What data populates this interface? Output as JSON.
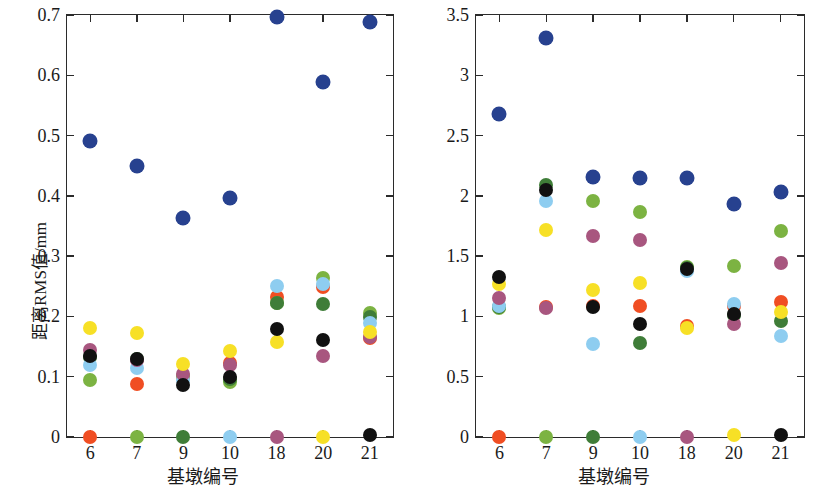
{
  "chart_data": [
    {
      "panel": "left",
      "type": "scatter",
      "title": "",
      "xlabel": "基墩编号",
      "ylabel": "距离RMS值/mm",
      "categories": [
        "6",
        "7",
        "9",
        "10",
        "18",
        "20",
        "21"
      ],
      "xtick_labels": [
        "6",
        "7",
        "9",
        "10",
        "18",
        "20",
        "21"
      ],
      "ytick_labels": [
        "0",
        "0.1",
        "0.2",
        "0.3",
        "0.4",
        "0.5",
        "0.6",
        "0.7"
      ],
      "ytick_values": [
        0,
        0.1,
        0.2,
        0.3,
        0.4,
        0.5,
        0.6,
        0.7
      ],
      "ylim": [
        0,
        0.7
      ],
      "grid": false,
      "legend": "none",
      "series": [
        {
          "name": "基墩6",
          "color": "#f04e23",
          "values": [
            0.0,
            0.088,
            0.1,
            0.122,
            0.232,
            0.248,
            0.165
          ]
        },
        {
          "name": "基墩7",
          "color": "#7cb342",
          "values": [
            0.095,
            0.0,
            0.101,
            0.092,
            0.223,
            0.264,
            0.205
          ]
        },
        {
          "name": "基墩9",
          "color": "#3f7d38",
          "values": [
            0.132,
            0.13,
            0.0,
            0.096,
            0.222,
            0.221,
            0.199
          ]
        },
        {
          "name": "基墩10",
          "color": "#8ecdf0",
          "values": [
            0.119,
            0.115,
            0.094,
            0.0,
            0.25,
            0.253,
            0.189
          ]
        },
        {
          "name": "基墩18",
          "color": "#a8567f",
          "values": [
            0.144,
            0.127,
            0.104,
            0.12,
            0.0,
            0.134,
            0.166
          ]
        },
        {
          "name": "基墩20",
          "color": "#f7e026",
          "values": [
            0.18,
            0.173,
            0.121,
            0.143,
            0.158,
            0.0,
            0.175
          ]
        },
        {
          "name": "基墩21",
          "color": "#111111",
          "values": [
            0.135,
            0.129,
            0.086,
            0.1,
            0.179,
            0.161,
            0.003
          ]
        },
        {
          "name": "整体",
          "color": "#27418f",
          "values": [
            0.491,
            0.449,
            0.364,
            0.396,
            0.697,
            0.589,
            0.688
          ]
        }
      ]
    },
    {
      "panel": "right",
      "type": "scatter",
      "title": "",
      "xlabel": "基墩编号",
      "ylabel": "垂直角RMS值/(″)",
      "categories": [
        "6",
        "7",
        "9",
        "10",
        "18",
        "20",
        "21"
      ],
      "xtick_labels": [
        "6",
        "7",
        "9",
        "10",
        "18",
        "20",
        "21"
      ],
      "ytick_labels": [
        "0",
        "0.5",
        "1",
        "1.5",
        "2",
        "2.5",
        "3",
        "3.5"
      ],
      "ytick_values": [
        0,
        0.5,
        1,
        1.5,
        2,
        2.5,
        3,
        3.5
      ],
      "ylim": [
        0,
        3.5
      ],
      "grid": false,
      "legend": "none",
      "series": [
        {
          "name": "基墩6",
          "color": "#f04e23",
          "values": [
            0.0,
            1.08,
            1.09,
            1.09,
            0.92,
            1.09,
            1.12
          ]
        },
        {
          "name": "基墩7",
          "color": "#7cb342",
          "values": [
            1.07,
            0.0,
            1.96,
            1.87,
            1.41,
            1.42,
            1.71
          ]
        },
        {
          "name": "基墩9",
          "color": "#3f7d38",
          "values": [
            1.08,
            2.09,
            0.0,
            0.78,
            1.4,
            1.01,
            0.96
          ]
        },
        {
          "name": "基墩10",
          "color": "#8ecdf0",
          "values": [
            1.09,
            1.96,
            0.77,
            0.0,
            1.38,
            1.1,
            0.84
          ]
        },
        {
          "name": "基墩18",
          "color": "#a8567f",
          "values": [
            1.15,
            1.07,
            1.67,
            1.63,
            0.0,
            0.94,
            1.44
          ]
        },
        {
          "name": "基墩20",
          "color": "#f7e026",
          "values": [
            1.27,
            1.72,
            1.22,
            1.28,
            0.9,
            0.02,
            1.04
          ]
        },
        {
          "name": "基墩21",
          "color": "#111111",
          "values": [
            1.33,
            2.05,
            1.08,
            0.94,
            1.39,
            1.02,
            0.02
          ]
        },
        {
          "name": "整体",
          "color": "#27418f",
          "values": [
            2.68,
            3.31,
            2.16,
            2.15,
            2.15,
            1.93,
            2.03
          ]
        }
      ]
    }
  ],
  "colors": {
    "axis": "#2b2b2b",
    "text": "#1a1a1a",
    "background": "#ffffff"
  }
}
